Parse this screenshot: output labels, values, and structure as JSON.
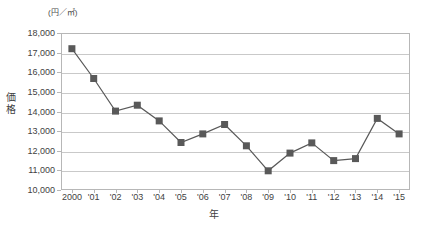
{
  "chart_data": {
    "type": "line",
    "title": "",
    "unit_label": "(円／㎡)",
    "xlabel": "年",
    "ylabel": "価格",
    "categories": [
      "2000",
      "'01",
      "'02",
      "'03",
      "'04",
      "'05",
      "'06",
      "'07",
      "'08",
      "'09",
      "'10",
      "'11",
      "'12",
      "'13",
      "'14",
      "'15"
    ],
    "x_full_years": [
      2000,
      2001,
      2002,
      2003,
      2004,
      2005,
      2006,
      2007,
      2008,
      2009,
      2010,
      2011,
      2012,
      2013,
      2014,
      2015
    ],
    "values": [
      17200,
      15680,
      14020,
      14320,
      13520,
      12420,
      12860,
      13340,
      12250,
      10980,
      11880,
      12400,
      11500,
      11600,
      13650,
      12860
    ],
    "ylim": [
      10000,
      18000
    ],
    "ytick_values": [
      18000,
      17000,
      16000,
      15000,
      14000,
      13000,
      12000,
      11000,
      10000
    ],
    "ytick_labels": [
      "18,000",
      "17,000",
      "16,000",
      "15,000",
      "14,000",
      "13,000",
      "12,000",
      "11,000",
      "10,000"
    ],
    "grid": true,
    "legend": "none",
    "series_color": "#595959",
    "gridline_color": "#c9c9c9",
    "marker": "square"
  }
}
